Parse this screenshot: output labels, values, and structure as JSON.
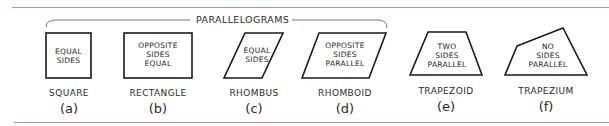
{
  "group": {
    "label": "PARALLELOGRAMS"
  },
  "colors": {
    "rule": "#c98a97",
    "stroke": "#1a1a1a"
  },
  "figures": [
    {
      "id": "a",
      "name": "SQUARE",
      "letter": "(a)",
      "lines": [
        "EQUAL",
        "SIDES"
      ]
    },
    {
      "id": "b",
      "name": "RECTANGLE",
      "letter": "(b)",
      "lines": [
        "OPPOSITE",
        "SIDES",
        "EQUAL"
      ]
    },
    {
      "id": "c",
      "name": "RHOMBUS",
      "letter": "(c)",
      "lines": [
        "EQUAL",
        "SIDES"
      ]
    },
    {
      "id": "d",
      "name": "RHOMBOID",
      "letter": "(d)",
      "lines": [
        "OPPOSITE",
        "SIDES",
        "PARALLEL"
      ]
    },
    {
      "id": "e",
      "name": "TRAPEZOID",
      "letter": "(e)",
      "lines": [
        "TWO",
        "SIDES",
        "PARALLEL"
      ]
    },
    {
      "id": "f",
      "name": "TRAPEZIUM",
      "letter": "(f)",
      "lines": [
        "NO",
        "SIDES",
        "PARALLEL"
      ]
    }
  ]
}
